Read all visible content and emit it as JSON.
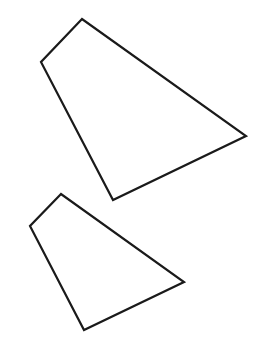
{
  "canvas": {
    "width": 260,
    "height": 363,
    "background": "#ffffff"
  },
  "shapes": [
    {
      "name": "large-quadrilateral",
      "points": "82,19 41,62 113,200 246,136",
      "stroke": "#1a1a1a"
    },
    {
      "name": "small-quadrilateral",
      "points": "61,194 30,226 84,330 184,282",
      "stroke": "#1a1a1a"
    }
  ]
}
